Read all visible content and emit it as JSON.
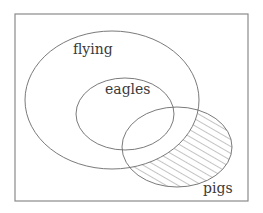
{
  "diagram": {
    "type": "venn",
    "universe": {
      "x": 15,
      "y": 14,
      "width": 233,
      "height": 187
    },
    "sets": [
      {
        "id": "flying",
        "label": "flying",
        "cx": 112,
        "cy": 100,
        "rx": 87,
        "ry": 69,
        "label_x": 73,
        "label_y": 54
      },
      {
        "id": "eagles",
        "label": "eagles",
        "cx": 125,
        "cy": 114,
        "rx": 49,
        "ry": 36,
        "label_x": 105,
        "label_y": 94
      },
      {
        "id": "pigs",
        "label": "pigs",
        "cx": 177,
        "cy": 147,
        "rx": 55,
        "ry": 40,
        "label_x": 203,
        "label_y": 193
      }
    ],
    "shaded_region": {
      "description": "pigs outside flying",
      "pattern": "diagonal-hatch",
      "hatch_spacing": 6,
      "hatch_angle": 60
    },
    "colors": {
      "stroke": "#6b6b6b",
      "frame": "#8a8a8a",
      "text": "#3a3a3a",
      "hatch": "#7a7a7a",
      "background": "#ffffff"
    }
  }
}
